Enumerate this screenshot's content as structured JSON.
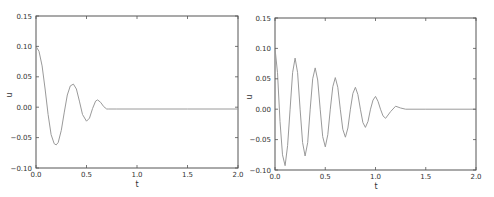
{
  "chart_data": [
    {
      "type": "line",
      "title": "",
      "xlabel": "t",
      "ylabel": "u",
      "xlim": [
        0.0,
        2.0
      ],
      "ylim": [
        -0.1,
        0.15
      ],
      "grid": false,
      "legend": null,
      "xticks": [
        "0.0",
        "0.5",
        "1.0",
        "1.5",
        "2.0"
      ],
      "yticks": [
        "0.15",
        "0.10",
        "0.05",
        "0.00",
        "-0.05",
        "-0.10"
      ],
      "line_color": "#9a9a9a",
      "series": [
        {
          "name": "u",
          "x": [
            0.0,
            0.03,
            0.06,
            0.09,
            0.12,
            0.15,
            0.18,
            0.2,
            0.22,
            0.25,
            0.28,
            0.31,
            0.34,
            0.37,
            0.4,
            0.43,
            0.46,
            0.5,
            0.53,
            0.56,
            0.59,
            0.61,
            0.64,
            0.67,
            0.7,
            0.72,
            0.8,
            1.0,
            1.5,
            2.0
          ],
          "values": [
            0.1,
            0.092,
            0.068,
            0.03,
            -0.012,
            -0.045,
            -0.06,
            -0.062,
            -0.058,
            -0.038,
            -0.008,
            0.02,
            0.035,
            0.038,
            0.03,
            0.01,
            -0.012,
            -0.023,
            -0.018,
            -0.002,
            0.01,
            0.012,
            0.008,
            0.001,
            -0.003,
            -0.003,
            -0.003,
            -0.003,
            -0.003,
            -0.003
          ]
        }
      ]
    },
    {
      "type": "line",
      "title": "",
      "xlabel": "t",
      "ylabel": "u",
      "xlim": [
        0.0,
        2.0
      ],
      "ylim": [
        -0.1,
        0.15
      ],
      "grid": false,
      "legend": null,
      "xticks": [
        "0.0",
        "0.5",
        "1.0",
        "1.5",
        "2.0"
      ],
      "yticks": [
        "0.15",
        "0.10",
        "0.05",
        "0.00",
        "-0.05",
        "-0.10"
      ],
      "line_color": "#9a9a9a",
      "series": [
        {
          "name": "u",
          "x": [
            0.0,
            0.025,
            0.05,
            0.075,
            0.1,
            0.125,
            0.15,
            0.175,
            0.2,
            0.225,
            0.25,
            0.275,
            0.3,
            0.325,
            0.35,
            0.375,
            0.4,
            0.425,
            0.45,
            0.475,
            0.5,
            0.525,
            0.55,
            0.575,
            0.6,
            0.625,
            0.65,
            0.675,
            0.7,
            0.725,
            0.75,
            0.775,
            0.8,
            0.825,
            0.85,
            0.875,
            0.9,
            0.925,
            0.95,
            0.975,
            1.0,
            1.025,
            1.05,
            1.075,
            1.1,
            1.15,
            1.2,
            1.25,
            1.3,
            1.5,
            2.0
          ],
          "values": [
            0.1,
            0.06,
            -0.02,
            -0.075,
            -0.093,
            -0.06,
            0.0,
            0.06,
            0.084,
            0.06,
            0.0,
            -0.055,
            -0.077,
            -0.055,
            0.0,
            0.05,
            0.068,
            0.048,
            0.0,
            -0.045,
            -0.062,
            -0.042,
            0.0,
            0.037,
            0.052,
            0.036,
            0.0,
            -0.033,
            -0.046,
            -0.031,
            0.0,
            0.026,
            0.036,
            0.024,
            0.0,
            -0.022,
            -0.03,
            -0.02,
            0.0,
            0.015,
            0.021,
            0.013,
            0.0,
            -0.011,
            -0.015,
            -0.004,
            0.005,
            0.002,
            0.0,
            0.0,
            0.0
          ]
        }
      ]
    }
  ],
  "charts": [
    {
      "xlabel": "t",
      "ylabel": "u",
      "xticks": [
        "0.0",
        "0.5",
        "1.0",
        "1.5",
        "2.0"
      ],
      "yticks": [
        "0.15",
        "0.10",
        "0.05",
        "0.00",
        "-0.05",
        "-0.10"
      ]
    },
    {
      "xlabel": "t",
      "ylabel": "u",
      "xticks": [
        "0.0",
        "0.5",
        "1.0",
        "1.5",
        "2.0"
      ],
      "yticks": [
        "0.15",
        "0.10",
        "0.05",
        "0.00",
        "-0.05",
        "-0.10"
      ]
    }
  ]
}
